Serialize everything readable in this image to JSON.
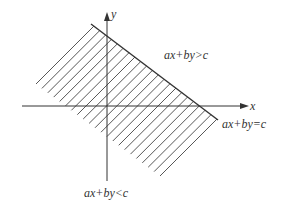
{
  "diagram": {
    "type": "half-plane inequality",
    "axes": {
      "x_label": "x",
      "y_label": "y"
    },
    "labels": {
      "upper_region": "ax+by>c",
      "boundary": "ax+by=c",
      "lower_region": "ax+by<c"
    },
    "colors": {
      "line": "#333333",
      "hatch": "#444444",
      "background": "#ffffff"
    }
  }
}
